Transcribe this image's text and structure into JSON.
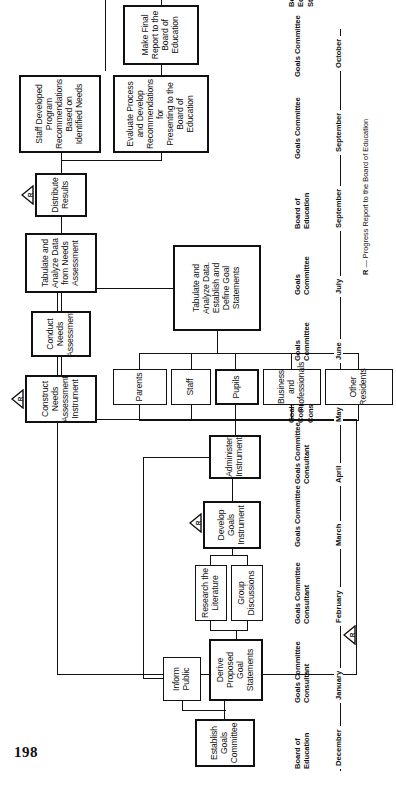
{
  "page": {
    "number": "198"
  },
  "figure": {
    "boxes": [
      {
        "id": "establish-goals-committee",
        "label": "Establish\nGoals\nCommittee"
      },
      {
        "id": "inform-public",
        "label": "Inform\nPublic"
      },
      {
        "id": "derive-proposed-goal-statements",
        "label": "Derive\nProposed Goal\nStatements"
      },
      {
        "id": "research-the-literature",
        "label": "Research the\nLiterature"
      },
      {
        "id": "group-discussions",
        "label": "Group\nDiscussions"
      },
      {
        "id": "develop-goals-instrument",
        "label": "Develop\nGoals\nInstrument"
      },
      {
        "id": "administer-instrument",
        "label": "Administer\nInstrument"
      },
      {
        "id": "parents",
        "label": "Parents"
      },
      {
        "id": "staff",
        "label": "Staff"
      },
      {
        "id": "pupils",
        "label": "Pupils"
      },
      {
        "id": "business-and-professionals",
        "label": "Business and\nProfessionals"
      },
      {
        "id": "other-residents",
        "label": "Other Residents"
      },
      {
        "id": "tabulate-analyze-establish-define",
        "label": "Tabulate and\nAnalyze Data.\nEstablish and\nDefine Goal\nStatements"
      },
      {
        "id": "construct-needs-assessment-instrument",
        "label": "Construct\nNeeds\nAssessment\nInstrument"
      },
      {
        "id": "conduct-needs-assessment",
        "label": "Conduct\nNeeds\nAssessment"
      },
      {
        "id": "tabulate-analyze-from-needs-assessment",
        "label": "Tabulate and\nAnalyze Data\nfrom Needs\nAssessment"
      },
      {
        "id": "distribute-results",
        "label": "Distribute\nResults"
      },
      {
        "id": "staff-developed-program-recommendations",
        "label": "Staff Developed Program\nRecommendations Based on\nIdentified Needs"
      },
      {
        "id": "evaluate-process-and-develop-recommendations",
        "label": "Evaluate Process and Develop\nRecommendations for\nPresenting to the\nBoard of Education"
      },
      {
        "id": "make-final-report",
        "label": "Make Final\nReport to the\nBoard of Education"
      },
      {
        "id": "program-changes",
        "label": "Program\nChanges"
      }
    ],
    "actors": [
      {
        "id": "actor-board-of-education-dec",
        "label": "Board of\nEducation"
      },
      {
        "id": "actor-goals-committee-consultant-jan",
        "label": "Goals Committee\nConsultant"
      },
      {
        "id": "actor-goals-committee-consultant-feb",
        "label": "Goals Committee\nConsultant"
      },
      {
        "id": "actor-goals-committee-mar",
        "label": "Goals Committee"
      },
      {
        "id": "actor-goals-committee-consultant-apr",
        "label": "Goals Committee\nConsultant"
      },
      {
        "id": "actor-goals-committee-consultant-may",
        "label": "Goals\nCommittee\nConsultant"
      },
      {
        "id": "actor-goals-committee-jun",
        "label": "Goals\nCommittee"
      },
      {
        "id": "actor-goals-committee-jul",
        "label": "Goals\nCommittee"
      },
      {
        "id": "actor-board-of-education-sep",
        "label": "Board of\nEducation"
      },
      {
        "id": "actor-goals-committee-sep2",
        "label": "Goals Committee"
      },
      {
        "id": "actor-goals-committee-oct",
        "label": "Goals Committee"
      },
      {
        "id": "actor-board-of-education-staff",
        "label": "Board of\nEducation\nStaff"
      }
    ],
    "timeline": {
      "months": [
        "December",
        "January",
        "February",
        "March",
        "April",
        "May",
        "June",
        "July",
        "September",
        "September",
        "October"
      ]
    },
    "markers": {
      "letter": "R"
    },
    "legend": {
      "symbol": "R",
      "dash": "—",
      "text": "Progress Report to the Board of Education"
    },
    "colors": {
      "ink": "#111111",
      "paper": "#ffffff"
    }
  }
}
